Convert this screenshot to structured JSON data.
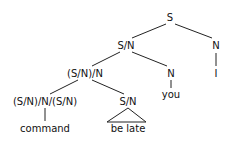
{
  "tree": {
    "nodes": [
      {
        "id": "root",
        "label": "S",
        "x": 170,
        "y": 13
      },
      {
        "id": "sn1",
        "label": "S/N",
        "x": 126,
        "y": 41
      },
      {
        "id": "n_right",
        "label": "N",
        "x": 216,
        "y": 41
      },
      {
        "id": "snn",
        "label": "(S/N)/N",
        "x": 85,
        "y": 69
      },
      {
        "id": "n_you",
        "label": "N",
        "x": 171,
        "y": 69
      },
      {
        "id": "i_leaf",
        "label": "I",
        "x": 216,
        "y": 69
      },
      {
        "id": "verb",
        "label": "(S/N)/N/(S/N)",
        "x": 45,
        "y": 97
      },
      {
        "id": "sn2",
        "label": "S/N",
        "x": 128,
        "y": 97
      },
      {
        "id": "you_leaf",
        "label": "you",
        "x": 171,
        "y": 90
      },
      {
        "id": "command_leaf",
        "label": "command",
        "x": 45,
        "y": 124
      },
      {
        "id": "belate_leaf",
        "label": "be late",
        "x": 128,
        "y": 124
      }
    ]
  }
}
